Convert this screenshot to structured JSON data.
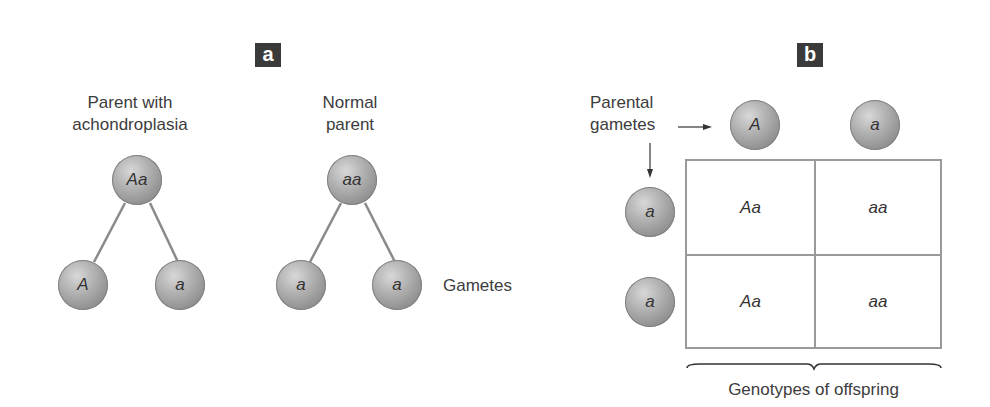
{
  "panel_a": {
    "label": "a",
    "parent1": {
      "title_line1": "Parent with",
      "title_line2": "achondroplasia",
      "genotype": "Aa",
      "gametes": [
        "A",
        "a"
      ]
    },
    "parent2": {
      "title_line1": "Normal",
      "title_line2": "parent",
      "genotype": "aa",
      "gametes": [
        "a",
        "a"
      ]
    },
    "gametes_label": "Gametes"
  },
  "panel_b": {
    "label": "b",
    "parental_gametes_line1": "Parental",
    "parental_gametes_line2": "gametes",
    "top_gametes": [
      "A",
      "a"
    ],
    "side_gametes": [
      "a",
      "a"
    ],
    "cells": [
      [
        "Aa",
        "aa"
      ],
      [
        "Aa",
        "aa"
      ]
    ],
    "offspring_label": "Genotypes of offspring"
  },
  "colors": {
    "label_bg": "#3a3a3a",
    "grid_line": "#9a9a9a",
    "ball": "#a8a8a8"
  }
}
